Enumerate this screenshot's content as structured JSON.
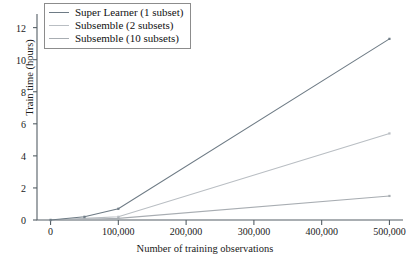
{
  "chart_data": {
    "type": "line",
    "title": "",
    "xlabel": "Number of training observations",
    "ylabel": "Train time (hours)",
    "xlim": [
      -20000,
      520000
    ],
    "ylim": [
      0,
      12.6
    ],
    "grid": false,
    "legend_position": "top-left",
    "xticks": [
      0,
      100000,
      200000,
      300000,
      400000,
      500000
    ],
    "xticklabels": [
      "0",
      "100,000",
      "200,000",
      "300,000",
      "400,000",
      "500,000"
    ],
    "yticks": [
      0,
      2,
      4,
      6,
      8,
      10,
      12
    ],
    "yticklabels": [
      "0",
      "2",
      "4",
      "6",
      "8",
      "10",
      "12"
    ],
    "x": [
      0,
      50000,
      100000,
      500000
    ],
    "series": [
      {
        "name": "Super Learner (1 subset)",
        "color": "#6e7b85",
        "values": [
          0.0,
          0.2,
          0.7,
          11.3
        ]
      },
      {
        "name": "Subsemble (2 subsets)",
        "color": "#b9bec3",
        "values": [
          0.0,
          0.1,
          0.2,
          5.4
        ]
      },
      {
        "name": "Subsemble (10 subsets)",
        "color": "#a8adb2",
        "values": [
          0.0,
          0.05,
          0.1,
          1.5
        ]
      }
    ]
  },
  "legend": {
    "items": [
      {
        "label": "Super Learner (1 subset)"
      },
      {
        "label": "Subsemble (2 subsets)"
      },
      {
        "label": "Subsemble (10 subsets)"
      }
    ]
  },
  "axes": {
    "y_title": "Train time (hours)",
    "x_title": "Number of training observations"
  },
  "style": {
    "axis_color": "#555f66",
    "text_color": "#1a1a1a",
    "legend_border": "#8c8c8c",
    "background": "#ffffff"
  }
}
